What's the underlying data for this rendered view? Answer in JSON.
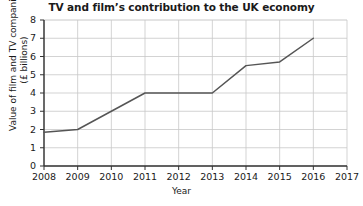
{
  "chart_data": {
    "type": "line",
    "title": "TV and film’s contribution to the UK economy",
    "xlabel": "Year",
    "ylabel": "Value of film and TV companies (£ billions)",
    "ylabel_line1": "Value of film and TV companies",
    "ylabel_line2": "(£ billions)",
    "x": [
      2008,
      2009,
      2010,
      2011,
      2012,
      2013,
      2014,
      2015,
      2016
    ],
    "values": [
      1.85,
      2.0,
      3.0,
      4.0,
      4.0,
      4.0,
      5.5,
      5.7,
      7.0
    ],
    "xticks": [
      "2008",
      "2009",
      "2010",
      "2011",
      "2012",
      "2013",
      "2014",
      "2015",
      "2016",
      "2017"
    ],
    "yticks": [
      "0",
      "1",
      "2",
      "3",
      "4",
      "5",
      "6",
      "7",
      "8"
    ],
    "xlim": [
      2008,
      2017
    ],
    "ylim": [
      0,
      8
    ],
    "grid": true,
    "legend": false,
    "series_color": "#555555",
    "grid_color": "#c8c8c8",
    "axis_color": "#333333",
    "background_color": "#ffffff"
  }
}
